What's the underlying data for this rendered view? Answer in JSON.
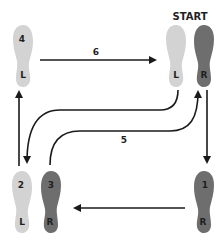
{
  "title": "START",
  "colors": {
    "left_foot": "#d3d3d3",
    "right_foot": "#6e6e6e",
    "line": "#1a1a1a",
    "text": "#1f1f1f"
  },
  "footprints": [
    {
      "id": "start-left",
      "side": "L",
      "step": "",
      "shade": "light"
    },
    {
      "id": "start-right",
      "side": "R",
      "step": "",
      "shade": "dark"
    },
    {
      "id": "step-1",
      "side": "R",
      "step": "1",
      "shade": "dark"
    },
    {
      "id": "step-2",
      "side": "L",
      "step": "2",
      "shade": "light"
    },
    {
      "id": "step-3",
      "side": "R",
      "step": "3",
      "shade": "dark"
    },
    {
      "id": "step-4",
      "side": "L",
      "step": "4",
      "shade": "light"
    }
  ],
  "arrows": [
    {
      "id": "arrow-start-right-to-1",
      "label": ""
    },
    {
      "id": "arrow-1-to-3",
      "label": ""
    },
    {
      "id": "arrow-2-to-4",
      "label": ""
    },
    {
      "id": "arrow-start-left-to-2",
      "label": ""
    },
    {
      "id": "arrow-3-to-start-right",
      "label": "5"
    },
    {
      "id": "arrow-4-to-start-left",
      "label": "6"
    }
  ]
}
